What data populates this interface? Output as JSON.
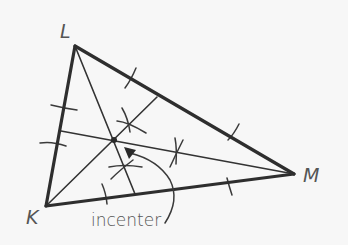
{
  "diagram": {
    "type": "geometric-construction",
    "background": "#f7f7f7",
    "line_color": "#2e2e2e",
    "vertices": [
      {
        "id": "L",
        "label": "L",
        "x": 75,
        "y": 46
      },
      {
        "id": "K",
        "label": "K",
        "x": 46,
        "y": 206
      },
      {
        "id": "M",
        "label": "M",
        "x": 294,
        "y": 174
      }
    ],
    "angle_bisectors": [
      {
        "from": "L",
        "to_side": "KM",
        "foot": {
          "x": 135,
          "y": 194
        }
      },
      {
        "from": "K",
        "to_side": "LM",
        "foot": {
          "x": 157,
          "y": 97
        }
      },
      {
        "from": "M",
        "to_side": "KL",
        "foot": {
          "x": 61,
          "y": 131
        }
      }
    ],
    "incenter": {
      "x": 114,
      "y": 140
    },
    "annotation": {
      "text": "incenter",
      "arrow_points_to": "incenter"
    }
  }
}
